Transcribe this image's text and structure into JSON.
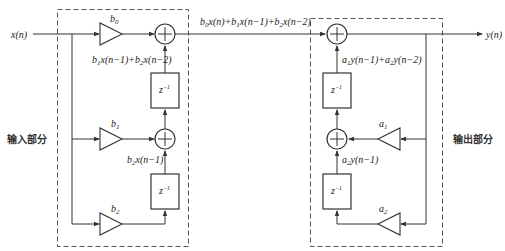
{
  "diagram": {
    "input_label": "x(n)",
    "output_label": "y(n)",
    "input_section_label": "输入部分",
    "output_section_label": "输出部分",
    "middle_signal_label": "b0x(n)+b1x(n−1)+b2x(n−2)",
    "input_section": {
      "coefficients": [
        "b0",
        "b1",
        "b2"
      ],
      "delay_label": "z−1",
      "node_labels": {
        "upper_sum": "b1x(n−1)+b2x(n−2)",
        "lower_sum": "b2x(n−1)"
      }
    },
    "output_section": {
      "coefficients": [
        "a1",
        "a2"
      ],
      "delay_label": "z−1",
      "node_labels": {
        "upper_sum": "a1y(n−1)+a2y(n−2)",
        "lower_sum": "a2y(n−1)"
      }
    }
  }
}
